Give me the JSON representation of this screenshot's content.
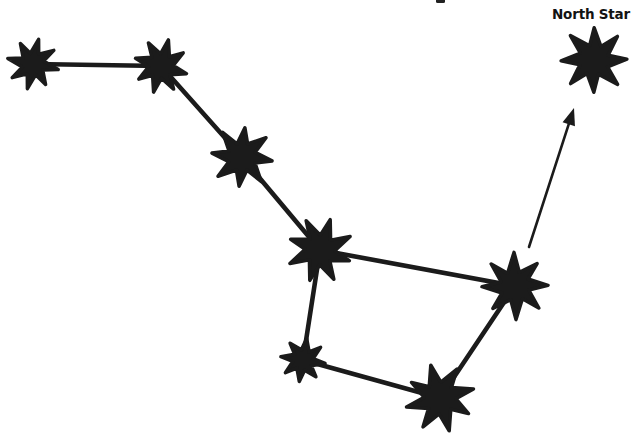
{
  "diagram": {
    "background": "#ffffff",
    "ink_color": "#1b1b1b",
    "label": {
      "text": "North Star",
      "x": 591,
      "y": 19
    },
    "cropped_title_fragment": {
      "x": 436,
      "y": -2,
      "width": 9,
      "height": 5
    },
    "stars": [
      {
        "id": "dipper-star-1",
        "x": 33,
        "y": 64,
        "r": 23,
        "rot": -80
      },
      {
        "id": "dipper-star-2",
        "x": 161,
        "y": 66,
        "r": 28,
        "rot": -72
      },
      {
        "id": "dipper-star-3",
        "x": 242,
        "y": 157,
        "r": 28,
        "rot": -86
      },
      {
        "id": "dipper-star-4",
        "x": 320,
        "y": 250,
        "r": 34,
        "rot": -68
      },
      {
        "id": "dipper-star-5",
        "x": 515,
        "y": 286,
        "r": 30,
        "rot": -94
      },
      {
        "id": "dipper-star-6",
        "x": 303,
        "y": 360,
        "r": 23,
        "rot": -79
      },
      {
        "id": "dipper-star-7",
        "x": 440,
        "y": 398,
        "r": 31,
        "rot": -63
      },
      {
        "id": "north-star",
        "x": 594,
        "y": 60,
        "r": 35,
        "rot": -88
      }
    ],
    "edges": [
      [
        0,
        1
      ],
      [
        1,
        2
      ],
      [
        2,
        3
      ],
      [
        3,
        4
      ],
      [
        3,
        5
      ],
      [
        5,
        6
      ],
      [
        6,
        4
      ]
    ],
    "edge_width": 4.6,
    "arrow": {
      "x1": 529,
      "y1": 247,
      "x2": 574,
      "y2": 108,
      "width": 2.6,
      "head_length": 17,
      "head_half_width": 6.5
    }
  }
}
